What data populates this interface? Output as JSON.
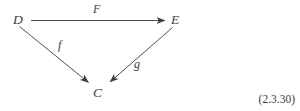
{
  "figure": {
    "type": "commutative-diagram",
    "equation_number": "(2.3.30)",
    "background_color": "#ffffff",
    "ink_color": "#3c3c3c",
    "nodes": [
      {
        "id": "D",
        "label": "D",
        "x": 22,
        "y": 20
      },
      {
        "id": "E",
        "label": "E",
        "x": 177,
        "y": 20
      },
      {
        "id": "C",
        "label": "C",
        "x": 99,
        "y": 93
      }
    ],
    "edges": [
      {
        "id": "F",
        "label": "F",
        "from": "D",
        "to": "E",
        "label_x": 99,
        "label_y": 9
      },
      {
        "id": "f",
        "label": "f",
        "from": "D",
        "to": "C",
        "label_x": 62,
        "label_y": 46
      },
      {
        "id": "g",
        "label": "g",
        "from": "E",
        "to": "C",
        "label_x": 139,
        "label_y": 65
      }
    ]
  }
}
